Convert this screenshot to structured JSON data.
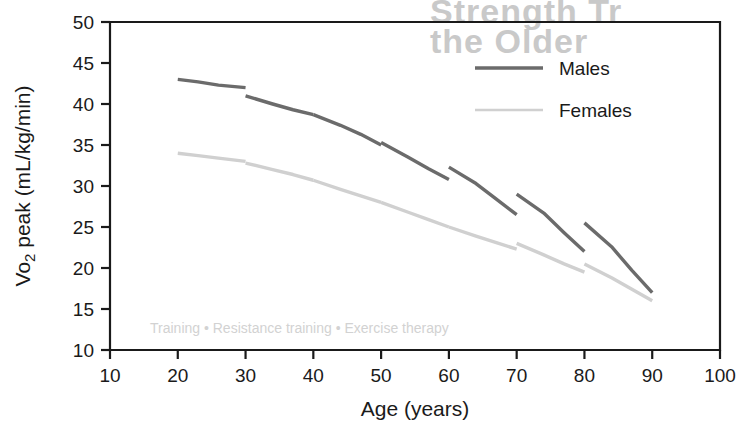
{
  "chart_data": {
    "type": "line",
    "title": "",
    "xlabel": "Age (years)",
    "ylabel_parts": {
      "pre": "V",
      "sub": "o",
      "sub2": "2",
      "post": " peak (mL/kg/min)"
    },
    "ylabel": "Vo2 peak (mL/kg/min)",
    "xlim": [
      10,
      100
    ],
    "ylim": [
      10,
      50
    ],
    "xticks": [
      10,
      20,
      30,
      40,
      50,
      60,
      70,
      80,
      90,
      100
    ],
    "yticks": [
      10,
      15,
      20,
      25,
      30,
      35,
      40,
      45,
      50
    ],
    "grid": false,
    "legend_position": "top-right",
    "series": [
      {
        "name": "Males",
        "color": "#6b6b6b",
        "segments": [
          {
            "age_range": [
              20,
              30
            ],
            "x": [
              20,
              23,
              26,
              30
            ],
            "y": [
              43.0,
              42.7,
              42.3,
              42.0
            ]
          },
          {
            "age_range": [
              30,
              40
            ],
            "x": [
              30,
              34,
              37,
              40
            ],
            "y": [
              41.0,
              40.0,
              39.3,
              38.7
            ]
          },
          {
            "age_range": [
              40,
              50
            ],
            "x": [
              40,
              44,
              47,
              50
            ],
            "y": [
              38.7,
              37.4,
              36.3,
              35.0
            ]
          },
          {
            "age_range": [
              50,
              60
            ],
            "x": [
              50,
              54,
              57,
              60
            ],
            "y": [
              35.3,
              33.5,
              32.1,
              30.8
            ]
          },
          {
            "age_range": [
              60,
              70
            ],
            "x": [
              60,
              64,
              67,
              70
            ],
            "y": [
              32.3,
              30.3,
              28.4,
              26.5
            ]
          },
          {
            "age_range": [
              70,
              80
            ],
            "x": [
              70,
              74,
              77,
              80
            ],
            "y": [
              29.0,
              26.7,
              24.3,
              22.0
            ]
          },
          {
            "age_range": [
              80,
              90
            ],
            "x": [
              80,
              84,
              87,
              90
            ],
            "y": [
              25.5,
              22.6,
              19.7,
              17.0
            ]
          }
        ]
      },
      {
        "name": "Females",
        "color": "#d0d0d0",
        "segments": [
          {
            "age_range": [
              20,
              30
            ],
            "x": [
              20,
              23,
              26,
              30
            ],
            "y": [
              34.0,
              33.7,
              33.4,
              33.0
            ]
          },
          {
            "age_range": [
              30,
              40
            ],
            "x": [
              30,
              34,
              37,
              40
            ],
            "y": [
              32.8,
              32.0,
              31.4,
              30.7
            ]
          },
          {
            "age_range": [
              40,
              50
            ],
            "x": [
              40,
              44,
              47,
              50
            ],
            "y": [
              30.7,
              29.6,
              28.8,
              28.0
            ]
          },
          {
            "age_range": [
              50,
              60
            ],
            "x": [
              50,
              54,
              57,
              60
            ],
            "y": [
              28.0,
              26.8,
              25.9,
              25.0
            ]
          },
          {
            "age_range": [
              60,
              70
            ],
            "x": [
              60,
              64,
              67,
              70
            ],
            "y": [
              25.0,
              23.9,
              23.1,
              22.3
            ]
          },
          {
            "age_range": [
              70,
              80
            ],
            "x": [
              70,
              74,
              77,
              80
            ],
            "y": [
              23.0,
              21.6,
              20.5,
              19.5
            ]
          },
          {
            "age_range": [
              80,
              90
            ],
            "x": [
              80,
              84,
              87,
              90
            ],
            "y": [
              20.5,
              18.8,
              17.4,
              16.0
            ]
          }
        ]
      }
    ]
  },
  "legend": {
    "items": [
      {
        "label": "Males",
        "color": "#6b6b6b"
      },
      {
        "label": "Females",
        "color": "#d0d0d0"
      }
    ]
  },
  "background_bleed": {
    "line1": "Strength Tr",
    "line2": "the Older",
    "line3": "Training • Resistance training • Exercise therapy"
  }
}
